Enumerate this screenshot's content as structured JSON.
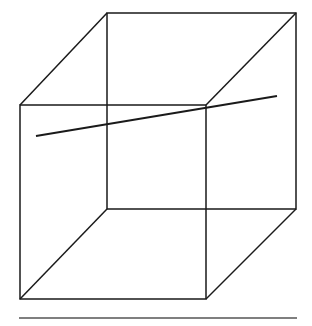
{
  "figure": {
    "kind": "line-drawing",
    "background_color": "#ffffff",
    "stroke_color": "#1a1a1a",
    "canvas": {
      "width": 312,
      "height": 326
    },
    "caption": ""
  },
  "geometry": {
    "description": "Axonometric wireframe cube: front square, back square offset up-right, four connecting edges, plus one long straight line crossing the figure.",
    "vertices": {
      "front_top_left": {
        "x": 20,
        "y": 105
      },
      "front_top_right": {
        "x": 206,
        "y": 105
      },
      "front_bottom_right": {
        "x": 206,
        "y": 299
      },
      "front_bottom_left": {
        "x": 20,
        "y": 299
      },
      "back_top_left": {
        "x": 107,
        "y": 13
      },
      "back_top_right": {
        "x": 296,
        "y": 13
      },
      "back_bottom_right": {
        "x": 296,
        "y": 209
      },
      "back_bottom_left": {
        "x": 107,
        "y": 209
      }
    },
    "front_face_points": "20,105 206,105 206,299 20,299",
    "back_face_points": "107,13 296,13 296,209 107,209",
    "connector_edges": [
      {
        "name": "edge-top-left-connector",
        "from": "front_top_left",
        "to": "back_top_left",
        "d": "M 20 105 L 107 13"
      },
      {
        "name": "edge-top-right-connector",
        "from": "front_top_right",
        "to": "back_top_right",
        "d": "M 206 105 L 296 13"
      },
      {
        "name": "edge-bottom-right-connector",
        "from": "front_bottom_right",
        "to": "back_bottom_right",
        "d": "M 206 299 L 296 209"
      },
      {
        "name": "edge-bottom-left-connector",
        "from": "front_bottom_left",
        "to": "back_bottom_left",
        "d": "M 20 299 L 107 209"
      }
    ],
    "crossing_line": {
      "name": "crossing-line",
      "from": {
        "x": 36,
        "y": 136
      },
      "to": {
        "x": 277,
        "y": 96
      },
      "d": "M 36 136 L 277 96",
      "passes_through_vertex": "front_top_right",
      "stroke_width": 2.0
    },
    "baseline_rule": {
      "name": "baseline-rule",
      "from": {
        "x": 19,
        "y": 318
      },
      "to": {
        "x": 297,
        "y": 318
      },
      "d": "M 19 318 L 297 318",
      "stroke_width": 1.6
    },
    "stroke_widths": {
      "cube_edge": 1.5,
      "crossing_line": 2.0,
      "baseline_rule": 1.6
    }
  },
  "labels": {
    "front_top_left": "",
    "front_top_right": "",
    "front_bottom_right": "",
    "front_bottom_left": "",
    "back_top_left": "",
    "back_top_right": "",
    "back_bottom_right": "",
    "back_bottom_left": ""
  }
}
